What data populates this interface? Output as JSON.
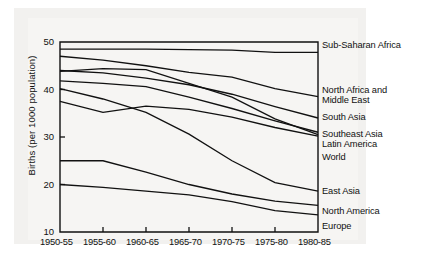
{
  "chart_data": {
    "type": "line",
    "title": "",
    "xlabel": "",
    "ylabel": "Births (per 1000 population)",
    "categories": [
      "1950-55",
      "1955-60",
      "1960-65",
      "1965-70",
      "1970-75",
      "1975-80",
      "1980-85"
    ],
    "ylim": [
      10,
      50
    ],
    "yticks": [
      10,
      20,
      30,
      40,
      50
    ],
    "grid": false,
    "legend_position": "right-of-axes",
    "series": [
      {
        "name": "Sub-Saharan Africa",
        "values": [
          48.5,
          48.5,
          48.5,
          48.4,
          48.3,
          47.8,
          47.8
        ]
      },
      {
        "name": "North Africa and Middle East",
        "values": [
          47.0,
          46.2,
          45.0,
          43.6,
          42.6,
          40.2,
          38.5
        ]
      },
      {
        "name": "South Asia",
        "values": [
          44.0,
          43.5,
          42.4,
          41.0,
          39.0,
          36.4,
          34.0
        ]
      },
      {
        "name": "Southeast Asia",
        "values": [
          43.8,
          44.4,
          44.2,
          41.3,
          38.4,
          33.8,
          30.5
        ]
      },
      {
        "name": "Latin America",
        "values": [
          41.8,
          41.3,
          40.6,
          38.4,
          36.0,
          33.4,
          31.0
        ]
      },
      {
        "name": "World",
        "values": [
          37.5,
          35.2,
          36.5,
          35.8,
          34.2,
          32.0,
          30.2
        ]
      },
      {
        "name": "East Asia",
        "values": [
          40.2,
          38.0,
          35.2,
          30.6,
          25.0,
          20.4,
          18.6
        ]
      },
      {
        "name": "North America",
        "values": [
          25.0,
          25.0,
          22.6,
          20.0,
          18.0,
          16.5,
          15.6
        ]
      },
      {
        "name": "Europe",
        "values": [
          20.0,
          19.4,
          18.6,
          17.8,
          16.4,
          14.5,
          13.6
        ]
      }
    ]
  },
  "legend": {
    "entries": [
      {
        "label": "Sub-Saharan Africa",
        "top": 40
      },
      {
        "label": "North Africa and",
        "top": 85
      },
      {
        "label": "Middle East",
        "top": 95
      },
      {
        "label": "South Asia",
        "top": 112
      },
      {
        "label": "Southeast Asia",
        "top": 129
      },
      {
        "label": "Latin America",
        "top": 139
      },
      {
        "label": "World",
        "top": 152
      },
      {
        "label": "East Asia",
        "top": 186
      },
      {
        "label": "North America",
        "top": 206
      },
      {
        "label": "Europe",
        "top": 221
      }
    ]
  },
  "axis": {
    "y_title": "Births (per 1000 population)",
    "y_ticks": [
      "50",
      "40",
      "30",
      "20",
      "10"
    ],
    "x_ticks": [
      "1950-55",
      "1955-60",
      "1960-65",
      "1965-70",
      "1970-75",
      "1975-80",
      "1980-85"
    ]
  },
  "colors": {
    "ink": "#111111",
    "paper": "#ffffff",
    "wash": "#f2f1ef"
  }
}
